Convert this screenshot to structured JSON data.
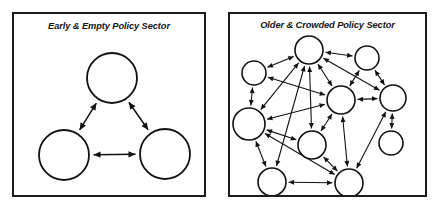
{
  "figure": {
    "panel_count": 2,
    "background_color": "#ffffff",
    "stroke_color": "#111111"
  },
  "panels": [
    {
      "id": "early-empty",
      "title": "Early & Empty Policy Sector",
      "frame": {
        "x": 12,
        "y": 12,
        "width": 194,
        "height": 185
      },
      "node_count": 3,
      "edge_count": 3,
      "nodes": [
        {
          "id": "n1",
          "label": "",
          "cx": 98,
          "cy": 64,
          "r": 25
        },
        {
          "id": "n2",
          "label": "",
          "cx": 50,
          "cy": 141,
          "r": 25
        },
        {
          "id": "n3",
          "label": "",
          "cx": 151,
          "cy": 140,
          "r": 25
        }
      ],
      "edges": [
        {
          "from": "n1",
          "to": "n2",
          "direction": "both"
        },
        {
          "from": "n1",
          "to": "n3",
          "direction": "both"
        },
        {
          "from": "n2",
          "to": "n3",
          "direction": "both"
        }
      ]
    },
    {
      "id": "older-crowded",
      "title": "Older & Crowded Policy Sector",
      "frame": {
        "x": 228,
        "y": 12,
        "width": 199,
        "height": 185
      },
      "node_count": 10,
      "edge_count": 22,
      "nodes": [
        {
          "id": "m1",
          "label": "",
          "cx": 79,
          "cy": 36,
          "r": 14
        },
        {
          "id": "m2",
          "label": "",
          "cx": 24,
          "cy": 59,
          "r": 12
        },
        {
          "id": "m3",
          "label": "",
          "cx": 137,
          "cy": 44,
          "r": 12
        },
        {
          "id": "m4",
          "label": "",
          "cx": 111,
          "cy": 86,
          "r": 14
        },
        {
          "id": "m5",
          "label": "",
          "cx": 163,
          "cy": 84,
          "r": 13
        },
        {
          "id": "m6",
          "label": "",
          "cx": 19,
          "cy": 110,
          "r": 16
        },
        {
          "id": "m7",
          "label": "",
          "cx": 82,
          "cy": 131,
          "r": 14
        },
        {
          "id": "m8",
          "label": "",
          "cx": 161,
          "cy": 129,
          "r": 12
        },
        {
          "id": "m9",
          "label": "",
          "cx": 42,
          "cy": 168,
          "r": 14
        },
        {
          "id": "m10",
          "label": "",
          "cx": 119,
          "cy": 169,
          "r": 14
        }
      ],
      "edges": [
        {
          "from": "m1",
          "to": "m2",
          "direction": "both"
        },
        {
          "from": "m1",
          "to": "m3",
          "direction": "both"
        },
        {
          "from": "m1",
          "to": "m4",
          "direction": "both"
        },
        {
          "from": "m1",
          "to": "m5",
          "direction": "both"
        },
        {
          "from": "m1",
          "to": "m6",
          "direction": "both"
        },
        {
          "from": "m1",
          "to": "m7",
          "direction": "both"
        },
        {
          "from": "m1",
          "to": "m9",
          "direction": "both"
        },
        {
          "from": "m2",
          "to": "m6",
          "direction": "both"
        },
        {
          "from": "m2",
          "to": "m4",
          "direction": "both"
        },
        {
          "from": "m3",
          "to": "m4",
          "direction": "both"
        },
        {
          "from": "m3",
          "to": "m5",
          "direction": "both"
        },
        {
          "from": "m4",
          "to": "m5",
          "direction": "both"
        },
        {
          "from": "m4",
          "to": "m6",
          "direction": "both"
        },
        {
          "from": "m4",
          "to": "m7",
          "direction": "both"
        },
        {
          "from": "m4",
          "to": "m10",
          "direction": "both"
        },
        {
          "from": "m5",
          "to": "m8",
          "direction": "both"
        },
        {
          "from": "m5",
          "to": "m10",
          "direction": "both"
        },
        {
          "from": "m6",
          "to": "m7",
          "direction": "both"
        },
        {
          "from": "m6",
          "to": "m9",
          "direction": "both"
        },
        {
          "from": "m6",
          "to": "m10",
          "direction": "both"
        },
        {
          "from": "m7",
          "to": "m10",
          "direction": "both"
        },
        {
          "from": "m9",
          "to": "m10",
          "direction": "both"
        }
      ]
    }
  ]
}
